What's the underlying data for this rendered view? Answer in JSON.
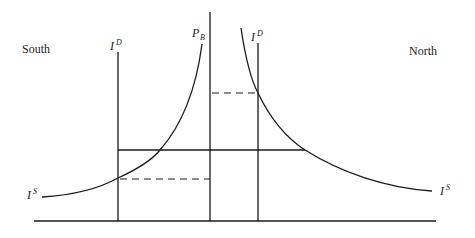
{
  "diagram": {
    "regions": {
      "left": "South",
      "right": "North"
    },
    "labels": {
      "price_line": {
        "base": "P",
        "sub": "B"
      },
      "demand_left": {
        "base": "I",
        "sup": "D"
      },
      "demand_right": {
        "base": "I",
        "sup": "D"
      },
      "supply_left": {
        "base": "I",
        "sup": "S"
      },
      "supply_right": {
        "base": "I",
        "sup": "S"
      }
    },
    "elements": [
      "South import demand curve (vertical)",
      "South import supply curve (rising)",
      "Border price line P_B (vertical)",
      "North import demand curve (vertical)",
      "North import supply curve (falling)",
      "Common equilibrium price level (solid horizontal)",
      "South supply-demand intersection level (dashed)",
      "North supply-demand intersection level (dashed)",
      "Horizontal axis"
    ]
  }
}
